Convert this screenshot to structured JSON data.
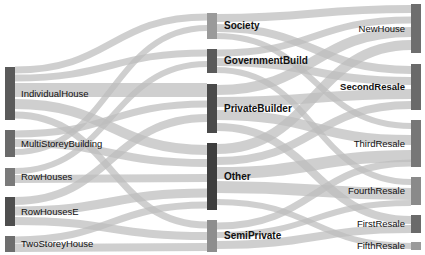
{
  "title": "",
  "colors": {
    "link": "#bdbdbd",
    "node_dark": "#555555",
    "node_mid": "#6f6f6f",
    "node_light": "#999999",
    "background": "#ffffff"
  },
  "nodes": {
    "left": [
      {
        "id": "IndividualHouse",
        "label": "IndividualHouse",
        "x": 5,
        "y0": 67,
        "y1": 120,
        "color": "#5a5a5a"
      },
      {
        "id": "MultiStoreyBuilding",
        "label": "MultiStoreyBuilding",
        "x": 5,
        "y0": 130,
        "y1": 157,
        "color": "#6a6a6a"
      },
      {
        "id": "RowHouses",
        "label": "RowHouses",
        "x": 5,
        "y0": 168,
        "y1": 186,
        "color": "#7a7a7a"
      },
      {
        "id": "RowHousesE",
        "label": "RowHousesE",
        "x": 5,
        "y0": 197,
        "y1": 226,
        "color": "#4e4e4e"
      },
      {
        "id": "TwoStoreyHouse",
        "label": "TwoStoreyHouse",
        "x": 5,
        "y0": 236,
        "y1": 252,
        "color": "#6e6e6e"
      }
    ],
    "middle": [
      {
        "id": "Society",
        "label": "Society",
        "x": 207,
        "y0": 13,
        "y1": 39,
        "color": "#9a9a9a"
      },
      {
        "id": "GovernmentBuild",
        "label": "GovernmentBuild",
        "x": 207,
        "y0": 49,
        "y1": 73,
        "color": "#5a5a5a"
      },
      {
        "id": "PrivateBuilder",
        "label": "PrivateBuilder",
        "x": 207,
        "y0": 84,
        "y1": 133,
        "color": "#4a4a4a"
      },
      {
        "id": "Other",
        "label": "Other",
        "x": 207,
        "y0": 143,
        "y1": 210,
        "color": "#3e3e3e"
      },
      {
        "id": "SemiPrivate",
        "label": "SemiPrivate",
        "x": 207,
        "y0": 220,
        "y1": 252,
        "color": "#8e8e8e"
      }
    ],
    "right": [
      {
        "id": "NewHouse",
        "label": "NewHouse",
        "x": 411,
        "y0": 4,
        "y1": 53,
        "color": "#6e6e6e",
        "bold": false
      },
      {
        "id": "SecondResale",
        "label": "SecondResale",
        "x": 411,
        "y0": 64,
        "y1": 110,
        "color": "#6a6a6a",
        "bold": true
      },
      {
        "id": "ThirdResale",
        "label": "ThirdResale",
        "x": 411,
        "y0": 120,
        "y1": 167,
        "color": "#777777",
        "bold": false
      },
      {
        "id": "FourthResale",
        "label": "FourthResale",
        "x": 411,
        "y0": 177,
        "y1": 205,
        "color": "#8a8a8a",
        "bold": false
      },
      {
        "id": "FirstResale",
        "label": "FirstResale",
        "x": 411,
        "y0": 215,
        "y1": 233,
        "color": "#6a6a6a",
        "bold": false
      },
      {
        "id": "FifthResale",
        "label": "FifthResale",
        "x": 411,
        "y0": 242,
        "y1": 250,
        "color": "#9a9a9a",
        "bold": false
      }
    ]
  },
  "links": [
    {
      "source": "IndividualHouse",
      "target": "Society",
      "sy": 70,
      "ty": 17,
      "w": 7
    },
    {
      "source": "IndividualHouse",
      "target": "GovernmentBuild",
      "sy": 78,
      "ty": 53,
      "w": 7
    },
    {
      "source": "IndividualHouse",
      "target": "PrivateBuilder",
      "sy": 90,
      "ty": 90,
      "w": 14
    },
    {
      "source": "IndividualHouse",
      "target": "Other",
      "sy": 104,
      "ty": 150,
      "w": 10
    },
    {
      "source": "IndividualHouse",
      "target": "SemiPrivate",
      "sy": 115,
      "ty": 225,
      "w": 7
    },
    {
      "source": "MultiStoreyBuilding",
      "target": "PrivateBuilder",
      "sy": 134,
      "ty": 104,
      "w": 7
    },
    {
      "source": "MultiStoreyBuilding",
      "target": "Other",
      "sy": 143,
      "ty": 163,
      "w": 8
    },
    {
      "source": "MultiStoreyBuilding",
      "target": "Society",
      "sy": 152,
      "ty": 28,
      "w": 6
    },
    {
      "source": "RowHouses",
      "target": "GovernmentBuild",
      "sy": 171,
      "ty": 64,
      "w": 6
    },
    {
      "source": "RowHouses",
      "target": "Other",
      "sy": 179,
      "ty": 178,
      "w": 8
    },
    {
      "source": "RowHousesE",
      "target": "PrivateBuilder",
      "sy": 201,
      "ty": 118,
      "w": 8
    },
    {
      "source": "RowHousesE",
      "target": "Other",
      "sy": 211,
      "ty": 193,
      "w": 9
    },
    {
      "source": "RowHousesE",
      "target": "SemiPrivate",
      "sy": 221,
      "ty": 236,
      "w": 8
    },
    {
      "source": "TwoStoreyHouse",
      "target": "Other",
      "sy": 240,
      "ty": 205,
      "w": 7
    },
    {
      "source": "TwoStoreyHouse",
      "target": "SemiPrivate",
      "sy": 248,
      "ty": 247,
      "w": 8
    },
    {
      "source": "Society",
      "target": "NewHouse",
      "sy": 18,
      "ty": 9,
      "w": 8
    },
    {
      "source": "Society",
      "target": "SecondResale",
      "sy": 28,
      "ty": 70,
      "w": 8
    },
    {
      "source": "Society",
      "target": "ThirdResale",
      "sy": 36,
      "ty": 126,
      "w": 6
    },
    {
      "source": "GovernmentBuild",
      "target": "NewHouse",
      "sy": 53,
      "ty": 20,
      "w": 7
    },
    {
      "source": "GovernmentBuild",
      "target": "SecondResale",
      "sy": 62,
      "ty": 81,
      "w": 8
    },
    {
      "source": "GovernmentBuild",
      "target": "FourthResale",
      "sy": 70,
      "ty": 182,
      "w": 6
    },
    {
      "source": "PrivateBuilder",
      "target": "NewHouse",
      "sy": 90,
      "ty": 32,
      "w": 10
    },
    {
      "source": "PrivateBuilder",
      "target": "SecondResale",
      "sy": 102,
      "ty": 94,
      "w": 10
    },
    {
      "source": "PrivateBuilder",
      "target": "ThirdResale",
      "sy": 115,
      "ty": 140,
      "w": 10
    },
    {
      "source": "PrivateBuilder",
      "target": "FirstResale",
      "sy": 127,
      "ty": 220,
      "w": 8
    },
    {
      "source": "Other",
      "target": "NewHouse",
      "sy": 149,
      "ty": 45,
      "w": 10
    },
    {
      "source": "Other",
      "target": "SecondResale",
      "sy": 161,
      "ty": 105,
      "w": 8
    },
    {
      "source": "Other",
      "target": "ThirdResale",
      "sy": 173,
      "ty": 156,
      "w": 12
    },
    {
      "source": "Other",
      "target": "FourthResale",
      "sy": 187,
      "ty": 194,
      "w": 12
    },
    {
      "source": "Other",
      "target": "FifthResale",
      "sy": 202,
      "ty": 246,
      "w": 6
    },
    {
      "source": "SemiPrivate",
      "target": "ThirdResale",
      "sy": 226,
      "ty": 163,
      "w": 7
    },
    {
      "source": "SemiPrivate",
      "target": "FourthResale",
      "sy": 235,
      "ty": 203,
      "w": 6
    },
    {
      "source": "SemiPrivate",
      "target": "FirstResale",
      "sy": 245,
      "ty": 229,
      "w": 8
    }
  ]
}
